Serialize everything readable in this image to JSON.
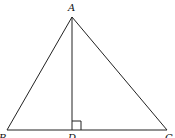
{
  "diagram": {
    "type": "triangle-with-altitude",
    "points": {
      "A": {
        "label": "A",
        "x": 72,
        "y": 17
      },
      "B": {
        "label": "B",
        "x": 7,
        "y": 130
      },
      "C": {
        "label": "C",
        "x": 167,
        "y": 130
      },
      "D": {
        "label": "D",
        "x": 72,
        "y": 130
      }
    },
    "segments": [
      "AB",
      "AC",
      "BC",
      "AD"
    ],
    "right_angle_at": "D",
    "stroke_color": "#222222",
    "background": "#ffffff"
  }
}
